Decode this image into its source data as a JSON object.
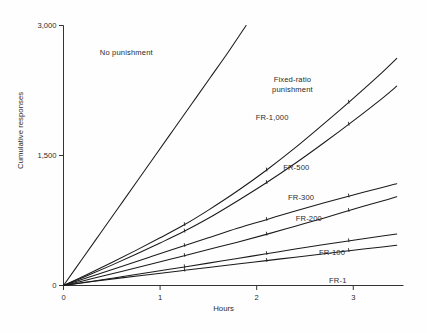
{
  "chart_data": {
    "type": "line",
    "title": "",
    "xlabel": "Hours",
    "ylabel": "Cumulative responses",
    "xlim": [
      0,
      3.52
    ],
    "ylim": [
      0,
      3000
    ],
    "xticks": [
      "0",
      "1",
      "2",
      "3"
    ],
    "xtick_values": [
      0,
      1,
      2,
      3
    ],
    "yticks": [
      "0",
      "1,500",
      "3,000"
    ],
    "ytick_values": [
      0,
      1500,
      3000
    ],
    "grid": false,
    "legend_position": "inline-annotations",
    "annotations": [
      {
        "text": "No punishment",
        "x": 0.65,
        "y": 2680
      },
      {
        "text_line1": "Fixed-ratio",
        "text_line2": "punishment",
        "x": 2.37,
        "y": 2360
      },
      {
        "text": "FR-1,000",
        "x": 2.16,
        "y": 1930
      },
      {
        "text": "FR-500",
        "x": 2.41,
        "y": 1360
      },
      {
        "text": "FR-300",
        "x": 2.46,
        "y": 1015
      },
      {
        "text": "FR-200",
        "x": 2.54,
        "y": 770
      },
      {
        "text": "FR-100",
        "x": 2.78,
        "y": 370
      },
      {
        "text": "FR-1",
        "x": 2.84,
        "y": 55
      }
    ],
    "series": [
      {
        "name": "No punishment",
        "x": [
          0,
          0.19,
          0.38,
          0.57,
          0.76,
          0.95,
          1.14,
          1.33,
          1.52,
          1.71,
          1.89
        ],
        "values": [
          0,
          300,
          600,
          900,
          1200,
          1500,
          1800,
          2100,
          2400,
          2700,
          3000
        ]
      },
      {
        "name": "FR-1,000",
        "x": [
          0,
          0.25,
          0.5,
          0.75,
          1.0,
          1.25,
          1.5,
          1.8,
          2.1,
          2.4,
          2.7,
          3.0,
          3.3,
          3.45
        ],
        "values": [
          0,
          130,
          265,
          405,
          550,
          700,
          870,
          1090,
          1330,
          1590,
          1870,
          2160,
          2460,
          2620
        ]
      },
      {
        "name": "FR-500",
        "x": [
          0,
          0.25,
          0.5,
          0.75,
          1.0,
          1.25,
          1.5,
          1.8,
          2.1,
          2.4,
          2.7,
          3.0,
          3.3,
          3.45
        ],
        "values": [
          0,
          115,
          235,
          360,
          490,
          625,
          775,
          975,
          1185,
          1410,
          1650,
          1900,
          2160,
          2300
        ]
      },
      {
        "name": "FR-300",
        "x": [
          0,
          0.3,
          0.6,
          0.9,
          1.2,
          1.5,
          1.8,
          2.1,
          2.4,
          2.7,
          3.0,
          3.3,
          3.45
        ],
        "values": [
          0,
          110,
          220,
          330,
          440,
          550,
          660,
          760,
          860,
          955,
          1045,
          1130,
          1175
        ]
      },
      {
        "name": "FR-200",
        "x": [
          0,
          0.3,
          0.6,
          0.9,
          1.2,
          1.5,
          1.8,
          2.1,
          2.4,
          2.7,
          3.0,
          3.3,
          3.45
        ],
        "values": [
          0,
          80,
          162,
          245,
          330,
          415,
          500,
          590,
          685,
          780,
          880,
          975,
          1025
        ]
      },
      {
        "name": "FR-100",
        "x": [
          0,
          0.3,
          0.6,
          0.9,
          1.2,
          1.5,
          1.8,
          2.1,
          2.4,
          2.7,
          3.0,
          3.3,
          3.45
        ],
        "values": [
          0,
          50,
          100,
          152,
          205,
          258,
          312,
          366,
          420,
          472,
          522,
          570,
          595
        ]
      },
      {
        "name": "FR-1",
        "x": [
          0,
          0.3,
          0.6,
          0.9,
          1.2,
          1.5,
          1.8,
          2.1,
          2.4,
          2.7,
          3.0,
          3.3,
          3.45
        ],
        "values": [
          0,
          45,
          88,
          128,
          168,
          208,
          247,
          287,
          327,
          367,
          407,
          445,
          465
        ]
      }
    ],
    "colors": {
      "line": "#1a1a1a",
      "axis": "#333333",
      "text": "#2b2b2b",
      "background": "#fefefe"
    }
  }
}
